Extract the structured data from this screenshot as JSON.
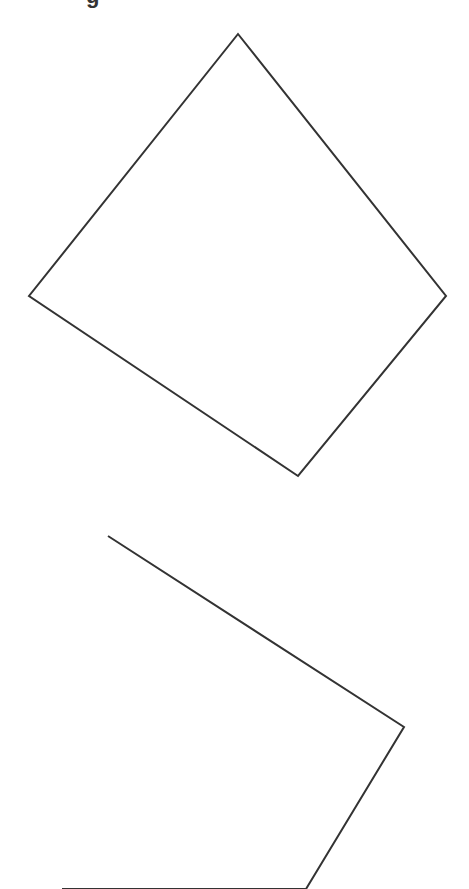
{
  "header": {
    "cut_text": "g"
  },
  "style": {
    "stroke": "#333333",
    "stroke_width": 2,
    "background": "#ffffff"
  },
  "shapes": [
    {
      "name": "quadrilateral-top",
      "points": [
        [
          238,
          34
        ],
        [
          446,
          296
        ],
        [
          298,
          476
        ],
        [
          29,
          296
        ]
      ]
    },
    {
      "name": "quadrilateral-bottom",
      "points": [
        [
          108,
          536
        ],
        [
          404,
          727
        ],
        [
          306,
          889
        ],
        [
          62,
          889
        ]
      ]
    }
  ]
}
